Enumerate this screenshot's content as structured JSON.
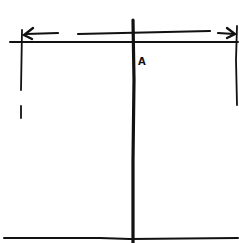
{
  "diagram": {
    "type": "hand-drawn sketch",
    "stroke_color": "#111111",
    "background": "#ffffff",
    "labels": [
      {
        "id": "point-a",
        "text": "A",
        "x": 140,
        "y": 60
      }
    ],
    "elements": [
      "top horizontal line",
      "bottom horizontal baseline",
      "central vertical line",
      "left vertical boundary line (dashed bottom)",
      "right vertical boundary line",
      "double-headed dimension arrow spanning width above top line"
    ]
  }
}
